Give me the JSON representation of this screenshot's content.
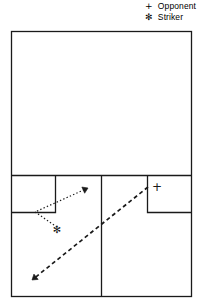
{
  "figure": {
    "title": "",
    "width": 204,
    "height": 304,
    "background": "#ffffff",
    "line_color": "#1a1a1a"
  },
  "legend": {
    "position": "top-right",
    "items": [
      {
        "marker": "+",
        "marker_name": "plus-marker",
        "label": "Opponent"
      },
      {
        "marker": "✻",
        "marker_name": "asterisk-marker",
        "label": "Striker"
      }
    ]
  },
  "court": {
    "name": "squash-court-plan",
    "outline": {
      "x": 11,
      "y": 31,
      "width": 180,
      "height": 265
    },
    "short_line": {
      "x1": 11,
      "y1": 175,
      "x2": 191,
      "y2": 175
    },
    "half_court_line": {
      "x1": 101,
      "y1": 175,
      "x2": 101,
      "y2": 296
    },
    "service_box_left": {
      "x": 11,
      "y": 175,
      "width": 44,
      "height": 37
    },
    "service_box_right": {
      "x": 147,
      "y": 175,
      "width": 44,
      "height": 37
    }
  },
  "markers": {
    "opponent": {
      "symbol": "+",
      "x": 157,
      "y": 187
    },
    "striker": {
      "symbol": "✻",
      "x": 57,
      "y": 229
    }
  },
  "paths": [
    {
      "name": "striker-movement-path",
      "style": "dotted",
      "arrow": "down-triangle",
      "points": [
        [
          57,
          227
        ],
        [
          35,
          212
        ],
        [
          88,
          188
        ]
      ]
    },
    {
      "name": "ball-trajectory-path",
      "style": "dashed",
      "arrow": "down-left-triangle",
      "points": [
        [
          148,
          187
        ],
        [
          32,
          280
        ]
      ]
    }
  ]
}
